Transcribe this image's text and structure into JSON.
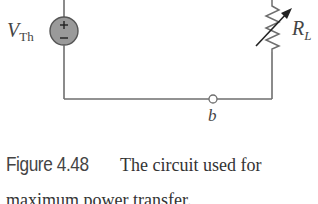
{
  "figure": {
    "source_label": {
      "main": "V",
      "sub": "Th"
    },
    "source_polarity": {
      "top": "+",
      "bottom": "−"
    },
    "load_label": {
      "main": "R",
      "sub": "L"
    },
    "terminal_label": "b",
    "caption": {
      "number": "Figure 4.48",
      "text_line1": "The circuit used for",
      "text_line2": "maximum power transfer."
    }
  },
  "colors": {
    "wire": "#6e6e6e",
    "source_fill": "#9a9a9a",
    "source_stroke": "#555555",
    "label_text": "#444444"
  }
}
